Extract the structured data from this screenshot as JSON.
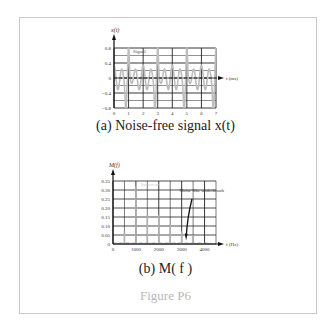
{
  "figure": {
    "label": "Figure P6",
    "caption_a": "(a)  Noise-free signal x(t)",
    "caption_b": "(b)  M( f )"
  },
  "chart_data": [
    {
      "type": "line",
      "title": "Signal",
      "ylabel": "x(t)",
      "xlabel": "t (ms)",
      "xlim": [
        0,
        7
      ],
      "ylim": [
        -0.8,
        0.8
      ],
      "x_ticks": [
        "0",
        "1",
        "2",
        "3",
        "4",
        "5",
        "6",
        "7"
      ],
      "y_ticks": [
        "0.8",
        "0.4",
        "0",
        "-0.4",
        "-0.8"
      ],
      "grid": true,
      "legend": "Signal",
      "period_ms": 2,
      "series": [
        {
          "name": "Signal",
          "x": [
            0,
            0.25,
            0.5,
            0.75,
            0.8,
            1.0,
            1.25,
            1.5,
            1.75,
            2.0,
            2.25,
            2.5,
            2.75,
            2.8,
            3.0,
            3.25,
            3.5,
            3.75,
            4.0,
            4.25,
            4.5,
            4.75,
            4.8,
            5.0,
            5.25,
            5.5,
            5.75,
            6.0,
            6.25,
            6.5,
            6.75,
            7.0
          ],
          "values": [
            0.2,
            -0.3,
            0.2,
            -0.5,
            -0.7,
            0.8,
            -0.2,
            0.2,
            -0.3,
            0.2,
            -0.3,
            0.2,
            -0.5,
            -0.7,
            0.8,
            -0.2,
            0.2,
            -0.3,
            0.2,
            -0.3,
            0.2,
            -0.5,
            -0.7,
            0.8,
            -0.2,
            0.2,
            -0.3,
            0.2,
            -0.3,
            0.2,
            -0.5,
            -0.4
          ]
        }
      ]
    },
    {
      "type": "bar",
      "title": "Spectrum",
      "ylabel": "M(f)",
      "xlabel": "f (Hz)",
      "xlim": [
        0,
        4500
      ],
      "ylim": [
        0,
        0.35
      ],
      "x_ticks": [
        "0",
        "1000",
        "2000",
        "3000",
        "4000"
      ],
      "y_ticks": [
        "0.35",
        "0.30",
        "0.25",
        "0.20",
        "0.15",
        "0.10",
        "0.05",
        "0"
      ],
      "grid": true,
      "legend": "Spectrum",
      "annotation": "Noise-like underbrush",
      "categories": [
        500,
        1000,
        1500,
        2000,
        2500,
        3000,
        3500
      ],
      "values": [
        0.07,
        0.32,
        0.16,
        0.16,
        0.11,
        0.07,
        0.05
      ]
    }
  ]
}
